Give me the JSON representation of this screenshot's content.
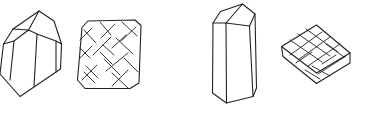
{
  "figure": {
    "width": 367,
    "height": 119,
    "background": "#ffffff",
    "stroke_color": "#222222",
    "panels": [
      {
        "id": "crystal-prism-short",
        "label": ""
      },
      {
        "id": "crystal-face-hatched-square",
        "label": ""
      },
      {
        "id": "crystal-prism-tall",
        "label": ""
      },
      {
        "id": "crystal-tabular-hatched",
        "label": ""
      }
    ]
  }
}
